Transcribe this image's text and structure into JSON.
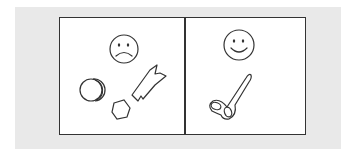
{
  "panels": [
    {
      "id": "left",
      "face": "sad-face-icon",
      "face_label": "sad face",
      "objects": [
        "coin",
        "hexagon-nut",
        "broken-piece"
      ]
    },
    {
      "id": "right",
      "face": "happy-face-icon",
      "face_label": "happy face",
      "objects": [
        "scissors"
      ]
    }
  ],
  "colors": {
    "background": "#e9e9e9",
    "frame": "#333333",
    "panel": "#ffffff",
    "stroke": "#333333"
  }
}
